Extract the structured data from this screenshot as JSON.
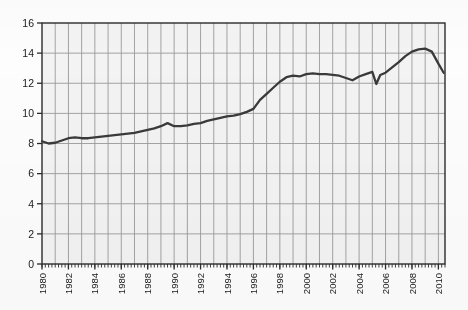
{
  "chart_data": {
    "type": "line",
    "title": "",
    "subtitle": "",
    "xlabel": "",
    "ylabel": "",
    "xlim": [
      1980,
      2010.5
    ],
    "ylim": [
      0,
      16
    ],
    "yticks": [
      0,
      2,
      4,
      6,
      8,
      10,
      12,
      14,
      16
    ],
    "ytick_labels": [
      "0",
      "2",
      "4",
      "6",
      "8",
      "10",
      "12",
      "14",
      "16"
    ],
    "xticks": [
      1980,
      1982,
      1984,
      1986,
      1988,
      1990,
      1992,
      1994,
      1996,
      1998,
      2000,
      2002,
      2004,
      2006,
      2008,
      2010
    ],
    "xtick_labels": [
      "1980",
      "1982",
      "1984",
      "1986",
      "1988",
      "1990",
      "1992",
      "1994",
      "1996",
      "1998",
      "2000",
      "2002",
      "2004",
      "2006",
      "2008",
      "2010"
    ],
    "x_minor_tick_interval": 0.25,
    "grid": {
      "vertical": "every year",
      "horizontal": "every 2 units",
      "color": "#9a9a9a"
    },
    "legend": null,
    "series": [
      {
        "name": "series-1",
        "color": "#3a3a3a",
        "x": [
          1980.0,
          1980.5,
          1981.0,
          1981.5,
          1982.0,
          1982.5,
          1983.0,
          1983.5,
          1984.0,
          1984.5,
          1985.0,
          1985.5,
          1986.0,
          1986.5,
          1987.0,
          1987.5,
          1988.0,
          1988.5,
          1989.0,
          1989.5,
          1990.0,
          1990.5,
          1991.0,
          1991.5,
          1992.0,
          1992.5,
          1993.0,
          1993.5,
          1994.0,
          1994.5,
          1995.0,
          1995.5,
          1996.0,
          1996.5,
          1997.0,
          1997.5,
          1998.0,
          1998.5,
          1999.0,
          1999.5,
          2000.0,
          2000.5,
          2001.0,
          2001.5,
          2002.0,
          2002.5,
          2003.0,
          2003.5,
          2004.0,
          2004.5,
          2005.0,
          2005.3,
          2005.6,
          2006.0,
          2006.5,
          2007.0,
          2007.5,
          2008.0,
          2008.5,
          2009.0,
          2009.5,
          2010.0,
          2010.4
        ],
        "y": [
          8.15,
          8.0,
          8.05,
          8.2,
          8.35,
          8.4,
          8.35,
          8.35,
          8.4,
          8.45,
          8.5,
          8.55,
          8.6,
          8.65,
          8.7,
          8.8,
          8.9,
          9.0,
          9.15,
          9.35,
          9.15,
          9.15,
          9.2,
          9.3,
          9.35,
          9.5,
          9.6,
          9.7,
          9.8,
          9.85,
          9.95,
          10.1,
          10.3,
          10.9,
          11.3,
          11.7,
          12.1,
          12.4,
          12.5,
          12.45,
          12.6,
          12.65,
          12.6,
          12.6,
          12.55,
          12.5,
          12.35,
          12.2,
          12.45,
          12.6,
          12.75,
          11.95,
          12.55,
          12.7,
          13.05,
          13.4,
          13.8,
          14.1,
          14.25,
          14.3,
          14.1,
          13.3,
          12.7
        ]
      }
    ]
  },
  "axis": {
    "frame_color": "#2a2a2a",
    "background": "#f4f4f4"
  }
}
